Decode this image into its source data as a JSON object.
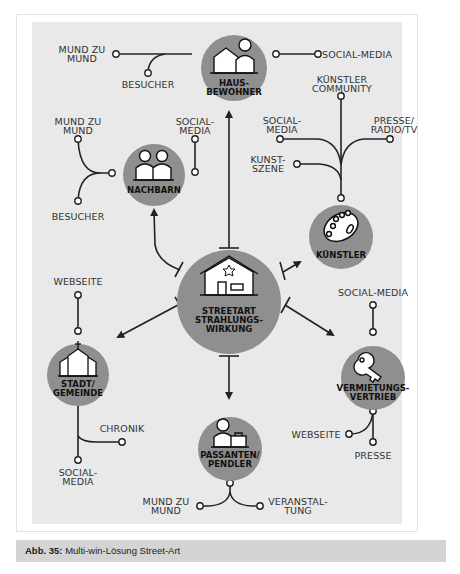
{
  "figure": {
    "caption_prefix": "Abb. 35:",
    "caption_text": "Multi-win-Lösung Street-Art",
    "colors": {
      "panel_bg": "#e9e9e9",
      "node_fill": "#8f8f8f",
      "line": "#222222",
      "caption_bg": "#d4d4d4"
    }
  },
  "center": {
    "label": "STREETART\nSTRAHLUNGS-\nWIRKUNG",
    "icon": "house-star-icon"
  },
  "nodes": {
    "hausbewohner": {
      "label": "HAUS-\nBEWOHNER",
      "icon": "house-person-icon",
      "channels": [
        "MUND ZU\nMUND",
        "BESUCHER",
        "SOCIAL-MEDIA"
      ]
    },
    "nachbarn": {
      "label": "NACHBARN",
      "icon": "two-people-icon",
      "channels": [
        "MUND ZU\nMUND",
        "BESUCHER",
        "SOCIAL-\nMEDIA"
      ]
    },
    "kuenstler": {
      "label": "KÜNSTLER",
      "icon": "palette-icon",
      "channels": [
        "KÜNSTLER\nCOMMUNITY",
        "SOCIAL-\nMEDIA",
        "PRESSE/\nRADIO/TV",
        "KUNST-\nSZENE"
      ]
    },
    "stadt": {
      "label": "STADT/\nGEMEINDE",
      "icon": "church-icon",
      "channels": [
        "WEBSEITE",
        "CHRONIK",
        "SOCIAL-\nMEDIA"
      ]
    },
    "vermietung": {
      "label": "VERMIETUNGS-\nVERTRIEB",
      "icon": "key-icon",
      "channels": [
        "SOCIAL-MEDIA",
        "WEBSEITE",
        "PRESSE"
      ]
    },
    "passanten": {
      "label": "PASSANTEN/\nPENDLER",
      "icon": "person-briefcase-icon",
      "channels": [
        "MUND ZU\nMUND",
        "VERANSTAL-\nTUNG"
      ]
    }
  }
}
